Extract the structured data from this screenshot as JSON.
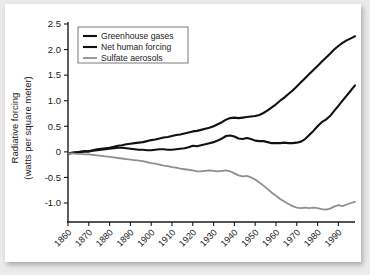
{
  "chart_data": {
    "type": "line",
    "title": "",
    "xlabel": "",
    "ylabel": "Radiative forcing (watts per square meter)",
    "ylabel_line1": "Radiative forcing",
    "ylabel_line2": "(watts per square meter)",
    "xlim": [
      1860,
      1998
    ],
    "ylim": [
      -1.3,
      2.5
    ],
    "grid": false,
    "legend_position": "top-left",
    "ytick_labels": [
      "2.5",
      "2.0",
      "1.5",
      "1.0",
      "0.5",
      "0",
      "-0.5",
      "-1.0"
    ],
    "ytick_values": [
      2.5,
      2.0,
      1.5,
      1.0,
      0.5,
      0,
      -0.5,
      -1.0
    ],
    "xtick_labels": [
      "1860",
      "1870",
      "1880",
      "1890",
      "1900",
      "1910",
      "1920",
      "1930",
      "1940",
      "1950",
      "1960",
      "1970",
      "1980",
      "1990"
    ],
    "xtick_values": [
      1860,
      1870,
      1880,
      1890,
      1900,
      1910,
      1920,
      1930,
      1940,
      1950,
      1960,
      1970,
      1980,
      1990
    ],
    "colors": {
      "greenhouse_gases": "#111111",
      "net_human_forcing": "#111111",
      "sulfate_aerosols": "#8f8f8f",
      "axis": "#1a1a1a",
      "card": "#ffffff",
      "page_background": "#eceaea"
    },
    "x": [
      1860,
      1862,
      1864,
      1866,
      1868,
      1870,
      1872,
      1874,
      1876,
      1878,
      1880,
      1882,
      1884,
      1886,
      1888,
      1890,
      1892,
      1894,
      1896,
      1898,
      1900,
      1902,
      1904,
      1906,
      1908,
      1910,
      1912,
      1914,
      1916,
      1918,
      1920,
      1922,
      1924,
      1926,
      1928,
      1930,
      1932,
      1934,
      1936,
      1938,
      1940,
      1942,
      1944,
      1946,
      1948,
      1950,
      1952,
      1954,
      1956,
      1958,
      1960,
      1962,
      1964,
      1966,
      1968,
      1970,
      1972,
      1974,
      1976,
      1978,
      1980,
      1982,
      1984,
      1986,
      1988,
      1990,
      1992,
      1994,
      1996,
      1998
    ],
    "series": [
      {
        "name": "Greenhouse gases",
        "color": "#111111",
        "values": [
          -0.03,
          -0.02,
          -0.01,
          0.0,
          0.01,
          0.01,
          0.03,
          0.05,
          0.06,
          0.07,
          0.08,
          0.1,
          0.12,
          0.13,
          0.15,
          0.16,
          0.17,
          0.18,
          0.19,
          0.21,
          0.23,
          0.24,
          0.26,
          0.28,
          0.29,
          0.31,
          0.33,
          0.34,
          0.36,
          0.38,
          0.4,
          0.41,
          0.43,
          0.45,
          0.47,
          0.5,
          0.54,
          0.58,
          0.63,
          0.66,
          0.67,
          0.66,
          0.67,
          0.68,
          0.69,
          0.7,
          0.72,
          0.76,
          0.81,
          0.87,
          0.93,
          1.0,
          1.06,
          1.13,
          1.2,
          1.28,
          1.36,
          1.44,
          1.52,
          1.6,
          1.68,
          1.76,
          1.84,
          1.92,
          2.0,
          2.07,
          2.13,
          2.18,
          2.22,
          2.26
        ]
      },
      {
        "name": "Net human forcing",
        "color": "#111111",
        "values": [
          -0.03,
          -0.02,
          -0.01,
          0.0,
          0.01,
          0.01,
          0.02,
          0.03,
          0.04,
          0.05,
          0.06,
          0.07,
          0.08,
          0.08,
          0.07,
          0.06,
          0.05,
          0.04,
          0.04,
          0.03,
          0.03,
          0.04,
          0.05,
          0.05,
          0.04,
          0.04,
          0.05,
          0.06,
          0.07,
          0.09,
          0.12,
          0.11,
          0.13,
          0.15,
          0.17,
          0.19,
          0.22,
          0.26,
          0.31,
          0.32,
          0.3,
          0.26,
          0.25,
          0.27,
          0.25,
          0.22,
          0.21,
          0.21,
          0.19,
          0.17,
          0.17,
          0.17,
          0.18,
          0.17,
          0.17,
          0.18,
          0.2,
          0.25,
          0.33,
          0.41,
          0.5,
          0.58,
          0.63,
          0.7,
          0.8,
          0.9,
          1.0,
          1.1,
          1.2,
          1.3
        ]
      },
      {
        "name": "Sulfate aerosols",
        "color": "#8f8f8f",
        "values": [
          -0.03,
          -0.03,
          -0.04,
          -0.04,
          -0.05,
          -0.05,
          -0.06,
          -0.07,
          -0.08,
          -0.09,
          -0.1,
          -0.11,
          -0.12,
          -0.13,
          -0.14,
          -0.15,
          -0.16,
          -0.17,
          -0.18,
          -0.2,
          -0.22,
          -0.23,
          -0.25,
          -0.27,
          -0.28,
          -0.3,
          -0.31,
          -0.33,
          -0.34,
          -0.35,
          -0.36,
          -0.38,
          -0.38,
          -0.37,
          -0.36,
          -0.37,
          -0.38,
          -0.37,
          -0.36,
          -0.38,
          -0.42,
          -0.46,
          -0.48,
          -0.47,
          -0.5,
          -0.54,
          -0.6,
          -0.66,
          -0.73,
          -0.8,
          -0.86,
          -0.92,
          -0.97,
          -1.02,
          -1.06,
          -1.09,
          -1.1,
          -1.09,
          -1.1,
          -1.09,
          -1.1,
          -1.12,
          -1.13,
          -1.11,
          -1.07,
          -1.04,
          -1.06,
          -1.03,
          -1.0,
          -0.98
        ]
      }
    ]
  },
  "legend": {
    "items": [
      {
        "label": "Greenhouse gases"
      },
      {
        "label": "Net human forcing"
      },
      {
        "label": "Sulfate aerosols"
      }
    ]
  }
}
